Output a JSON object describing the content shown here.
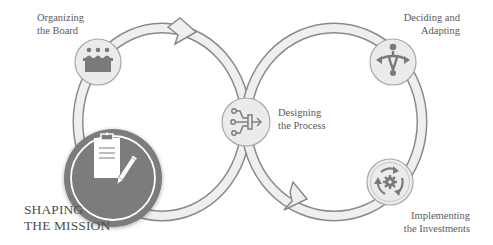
{
  "colors": {
    "ring_fill": "#efefef",
    "ring_stroke": "#8a8a8a",
    "node_fill": "#ebebeb",
    "node_stroke": "#a0a0a0",
    "icon": "#7a7a7a",
    "active_fill": "#7b7b7b",
    "active_ring": "#ffffff",
    "text": "#5a5a5a"
  },
  "nodes": [
    {
      "id": "organizing",
      "lines": [
        "Organizing",
        "the Board"
      ],
      "icon": "board-meeting-icon",
      "active": false
    },
    {
      "id": "shaping",
      "lines": [
        "SHAPING",
        "THE MISSION"
      ],
      "icon": "clipboard-pencil-icon",
      "active": true
    },
    {
      "id": "designing",
      "lines": [
        "Designing",
        "the Process"
      ],
      "icon": "process-merge-icon",
      "active": false
    },
    {
      "id": "deciding",
      "lines": [
        "Deciding and",
        "Adapting"
      ],
      "icon": "decision-split-icon",
      "active": false
    },
    {
      "id": "implementing",
      "lines": [
        "Implementing",
        "the Investments"
      ],
      "icon": "cycle-gear-icon",
      "active": false
    }
  ]
}
